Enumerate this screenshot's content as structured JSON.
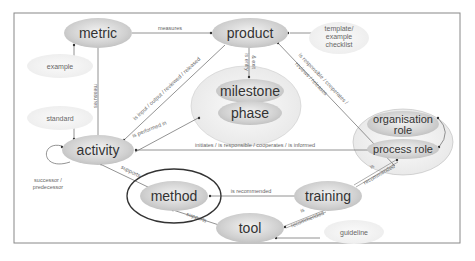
{
  "diagram": {
    "nodes": {
      "metric": "metric",
      "product": "product",
      "template": [
        "template/",
        "example",
        "checklist"
      ],
      "example": "example",
      "standard": "standard",
      "milestone": "milestone",
      "phase": "phase",
      "activity": "activity",
      "organisation_role": [
        "organisation",
        "role"
      ],
      "process_role": "process role",
      "method": "method",
      "training": "training",
      "tool": "tool",
      "guideline": "guideline"
    },
    "edges": {
      "metric_product": "measures",
      "metric_activity": "measures",
      "product_milestone": [
        "is entry",
        "& exit"
      ],
      "activity_product": "is input / output / reviewed / released",
      "activity_phase": "is performed in",
      "role_product_1": "is responsible / cooperates /",
      "role_product_2": "reviews / releases",
      "role_activity": "initiates / is responsible / cooperates / is informed",
      "activity_self": [
        "successor /",
        "predecessor"
      ],
      "method_activity": "supports",
      "training_method": "is recommended",
      "tool_method": "supports",
      "training_role": [
        "is",
        "recommended"
      ],
      "tool_training": [
        "is",
        "recommended"
      ]
    }
  }
}
